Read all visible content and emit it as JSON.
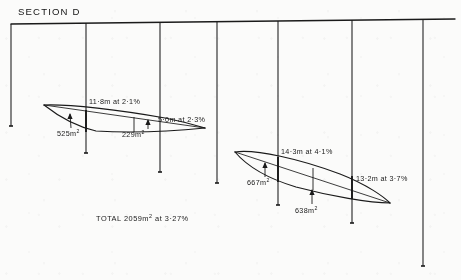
{
  "drawing": {
    "title": "SECTION D",
    "total_label": "TOTAL  2059m",
    "total_sup": "2",
    "total_tail": " at 3·27%",
    "ink_color": "#1a1a1a",
    "paper_color": "#fbfbfa"
  },
  "datum": {
    "name": "ground-line",
    "x1": 11,
    "y1": 24,
    "x2": 455,
    "y2": 19
  },
  "stations": [
    {
      "id": "s1",
      "x": 11,
      "y_top": 24,
      "y_bottom": 126
    },
    {
      "id": "s2",
      "x": 86,
      "y_top": 23,
      "y_bottom": 153
    },
    {
      "id": "s3",
      "x": 160,
      "y_top": 22,
      "y_bottom": 172
    },
    {
      "id": "s4",
      "x": 217,
      "y_top": 22,
      "y_bottom": 183
    },
    {
      "id": "s5",
      "x": 278,
      "y_top": 21,
      "y_bottom": 205
    },
    {
      "id": "s6",
      "x": 352,
      "y_top": 20,
      "y_bottom": 223
    },
    {
      "id": "s7",
      "x": 423,
      "y_top": 19,
      "y_bottom": 266
    }
  ],
  "figures": [
    {
      "id": "upper-section",
      "name": "upper-cut-section",
      "outline_upper": "M 44,105 C 70,104 120,110 165,118 C 185,122 198,126 205,128",
      "outline_lower": "M 44,105 C 58,116 74,126 96,131 C 130,133 175,131 205,128",
      "chord": "M 44,105 L 205,128",
      "dividers": [
        {
          "x": 86,
          "y1": 110,
          "y2": 132,
          "weight": 1.9
        },
        {
          "x": 134,
          "y1": 117,
          "y2": 132,
          "weight": 0.9
        }
      ],
      "dim_labels": [
        {
          "text": "11·8m at 2·1%",
          "x": 89,
          "y": 98
        },
        {
          "text": "5·0m at 2·3%",
          "x": 158,
          "y": 116
        }
      ],
      "area_labels": [
        {
          "text": "525m",
          "sup": "2",
          "x": 57,
          "y": 130,
          "leader": "M 71,128 L 70,114",
          "arrow": "M 70,113 L 67.4,119 L 72.6,119 Z"
        },
        {
          "text": "229m",
          "sup": "2",
          "x": 122,
          "y": 131,
          "leader": "M 148,129 L 148,120",
          "arrow": "M 148,119 L 145.4,125 L 150.6,125 Z"
        }
      ]
    },
    {
      "id": "lower-section",
      "name": "lower-cut-section",
      "outline_upper": "M 235,152 C 256,149 300,159 340,174 C 368,185 384,197 390,203",
      "outline_lower": "M 235,152 C 246,165 266,178 296,187 C 330,196 370,203 390,203",
      "chord": "M 235,152 L 390,203",
      "dividers": [
        {
          "x": 278,
          "y1": 157,
          "y2": 182,
          "weight": 1.9
        },
        {
          "x": 313,
          "y1": 168,
          "y2": 190,
          "weight": 0.9
        },
        {
          "x": 352,
          "y1": 176,
          "y2": 199,
          "weight": 1.9
        }
      ],
      "dim_labels": [
        {
          "text": "14·3m at 4·1%",
          "x": 281,
          "y": 148
        },
        {
          "text": "13·2m at 3·7%",
          "x": 356,
          "y": 175
        }
      ],
      "area_labels": [
        {
          "text": "667m",
          "sup": "2",
          "x": 247,
          "y": 179,
          "leader": "M 265,177 L 265,163",
          "arrow": "M 265,162 L 262.4,168 L 267.6,168 Z"
        },
        {
          "text": "638m",
          "sup": "2",
          "x": 295,
          "y": 207,
          "leader": "M 312,204 L 312,190",
          "arrow": "M 312,189 L 309.4,195 L 314.6,195 Z"
        }
      ]
    }
  ]
}
